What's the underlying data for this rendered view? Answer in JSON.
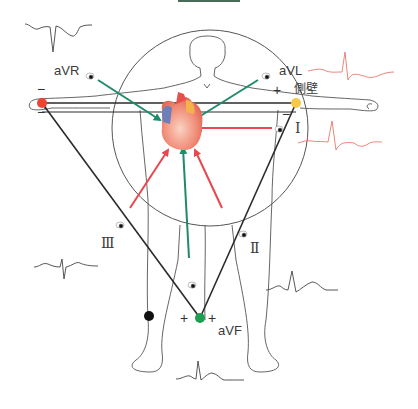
{
  "colors": {
    "bipolar_arrow": "#e8474f",
    "augmented_arrow": "#1f8a6c",
    "triangle": "#2b2b2b",
    "outline": "#555555",
    "right_arm_electrode": "#ee4433",
    "left_arm_electrode": "#f7c948",
    "left_leg_electrode": "#1e9e50",
    "right_leg_electrode": "#111111",
    "lateral_waveform": "#e8786a",
    "default_waveform": "#444444"
  },
  "leads": {
    "aVR": {
      "label": "aVR",
      "waveform_color": "#444444"
    },
    "aVL": {
      "label": "aVL",
      "waveform_color": "#e8786a"
    },
    "I": {
      "label": "Ⅰ",
      "waveform_color": "#e8786a"
    },
    "II": {
      "label": "Ⅱ",
      "waveform_color": "#444444"
    },
    "III": {
      "label": "Ⅲ",
      "waveform_color": "#444444"
    },
    "aVF": {
      "label": "aVF",
      "waveform_color": "#444444"
    }
  },
  "annotations": {
    "lateral_wall": "側壁",
    "plus": "+",
    "minus": "−"
  },
  "electrodes": [
    {
      "name": "right-arm",
      "color": "#ee4433"
    },
    {
      "name": "left-arm",
      "color": "#f7c948"
    },
    {
      "name": "left-leg",
      "color": "#1e9e50"
    },
    {
      "name": "right-leg",
      "color": "#111111"
    }
  ],
  "icons": [
    "eye-icon",
    "heart-icon",
    "body-outline"
  ]
}
